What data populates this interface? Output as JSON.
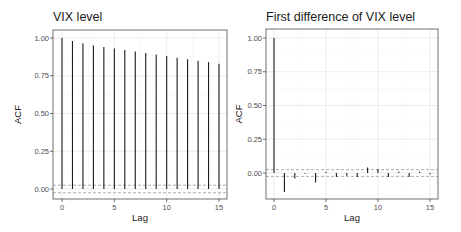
{
  "chart_data": [
    {
      "type": "bar",
      "subtype": "acf-lollipop",
      "title": "VIX level",
      "xlabel": "Lag",
      "ylabel": "ACF",
      "x": [
        0,
        1,
        2,
        3,
        4,
        5,
        6,
        7,
        8,
        9,
        10,
        11,
        12,
        13,
        14,
        15
      ],
      "values": [
        1.0,
        0.98,
        0.965,
        0.95,
        0.94,
        0.93,
        0.92,
        0.91,
        0.9,
        0.89,
        0.88,
        0.87,
        0.86,
        0.85,
        0.84,
        0.83
      ],
      "confidence_band": [
        -0.025,
        0.025
      ],
      "xlim": [
        -0.75,
        15.75
      ],
      "ylim": [
        -0.07,
        1.05
      ],
      "xticks": [
        "0",
        "5",
        "10",
        "15"
      ],
      "yticks": [
        "0.00",
        "0.25",
        "0.50",
        "0.75",
        "1.00"
      ],
      "grid": true
    },
    {
      "type": "bar",
      "subtype": "acf-lollipop",
      "title": "First difference of VIX level",
      "xlabel": "Lag",
      "ylabel": "ACF",
      "x": [
        0,
        1,
        2,
        3,
        4,
        5,
        6,
        7,
        8,
        9,
        10,
        11,
        12,
        13,
        14,
        15
      ],
      "values": [
        1.0,
        -0.14,
        -0.04,
        -0.005,
        -0.07,
        0.01,
        -0.03,
        -0.02,
        -0.03,
        0.04,
        0.03,
        -0.03,
        0.01,
        -0.03,
        0.01,
        -0.01
      ],
      "confidence_band": [
        -0.025,
        0.025
      ],
      "xlim": [
        -0.75,
        15.75
      ],
      "ylim": [
        -0.19,
        1.05
      ],
      "xticks": [
        "0",
        "5",
        "10",
        "15"
      ],
      "yticks": [
        "0.00",
        "0.25",
        "0.50",
        "0.75",
        "1.00"
      ],
      "grid": true
    }
  ],
  "panels": [
    {
      "title": "VIX level",
      "xlabel": "Lag",
      "ylabel": "ACF"
    },
    {
      "title": "First difference of VIX level",
      "xlabel": "Lag",
      "ylabel": "ACF"
    }
  ],
  "style": {
    "bar_color": "#1a1a1a",
    "grid_color": "#ebebeb",
    "border_color": "#333333",
    "band_color": "#999999"
  }
}
